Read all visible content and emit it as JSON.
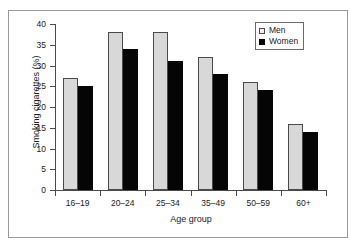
{
  "chart_data": {
    "type": "bar",
    "title": "",
    "xlabel": "Age group",
    "ylabel": "Smoking cigarettes (%)",
    "categories": [
      "16–19",
      "20–24",
      "25–34",
      "35–49",
      "50–59",
      "60+"
    ],
    "series": [
      {
        "name": "Men",
        "values": [
          27,
          38,
          38,
          32,
          26,
          16
        ],
        "color": "#d8d8d8"
      },
      {
        "name": "Women",
        "values": [
          25,
          34,
          31,
          28,
          24,
          14
        ],
        "color": "#050505"
      }
    ],
    "ylim": [
      0,
      40
    ],
    "yticks": [
      0,
      5,
      10,
      15,
      20,
      25,
      30,
      35,
      40
    ],
    "ytick_labels": [
      "0",
      "5",
      "10",
      "15",
      "20",
      "25",
      "30",
      "35",
      "40"
    ],
    "grid": false,
    "legend_position": "top-right",
    "legend_entries": [
      "Men",
      "Women"
    ]
  }
}
